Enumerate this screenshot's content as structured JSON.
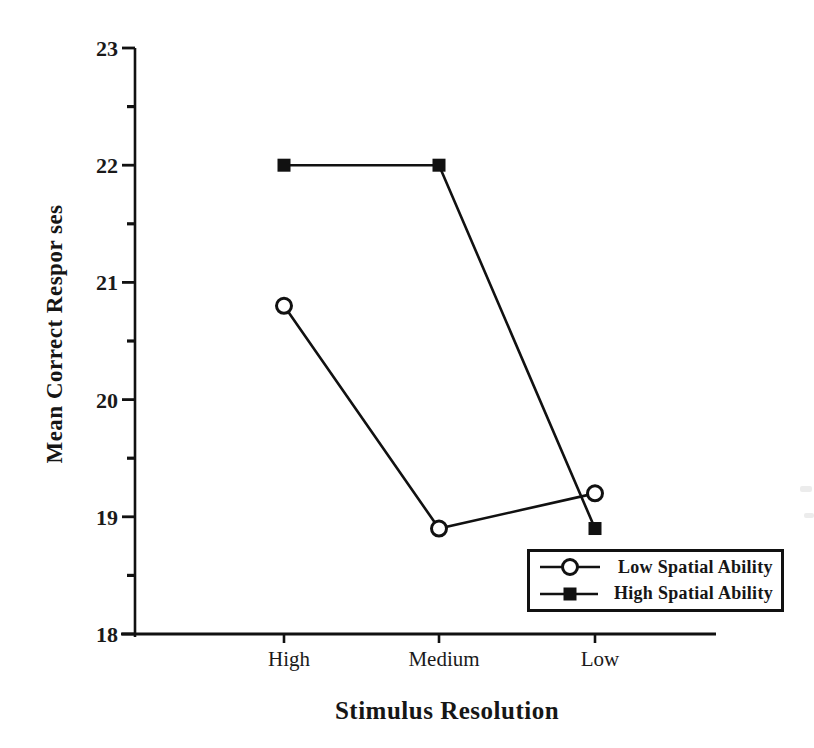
{
  "chart_data": {
    "type": "line",
    "categories": [
      "High",
      "Medium",
      "Low"
    ],
    "series": [
      {
        "name": "Low Spatial Ability",
        "marker": "open-circle",
        "values": [
          20.8,
          18.9,
          19.2
        ]
      },
      {
        "name": "High Spatial Ability",
        "marker": "filled-square",
        "values": [
          22.0,
          22.0,
          18.9
        ]
      }
    ],
    "title": "",
    "xlabel": "Stimulus Resolution",
    "ylabel": "Mean Correct Respor ses",
    "ylim": [
      18,
      23
    ],
    "y_ticks": [
      23,
      22,
      21,
      20,
      19,
      18
    ],
    "y_minor_tick_interval": 0.5,
    "grid": false,
    "legend_position": "lower-right-inside",
    "line_color": "#111111",
    "background_color": "#ffffff"
  }
}
